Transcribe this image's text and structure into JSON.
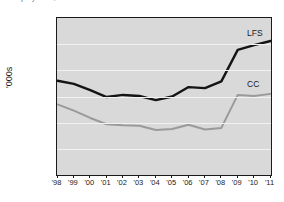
{
  "caption": {
    "clipped_text": "employment, 1998-2011"
  },
  "chart_data": {
    "type": "line",
    "title": "",
    "subtitle": "",
    "xlabel": "",
    "ylabel": "'000s",
    "x": [
      "'98",
      "'99",
      "'00",
      "'01",
      "'02",
      "'03",
      "'04",
      "'05",
      "'06",
      "'07",
      "'08",
      "'09",
      "'10",
      "'11"
    ],
    "ylim": [
      0,
      3000
    ],
    "yticks": [
      0,
      500,
      1000,
      1500,
      2000,
      2500,
      3000
    ],
    "ytick_labels": [
      "0",
      "500",
      "1000",
      "1500",
      "2000",
      "2500",
      "3000"
    ],
    "grid": true,
    "legend_position": "inline-annotation",
    "series": [
      {
        "name": "LFS",
        "color": "#141414",
        "values": [
          1800,
          1740,
          1620,
          1490,
          1530,
          1510,
          1430,
          1500,
          1680,
          1660,
          1790,
          2390,
          2480,
          2560
        ]
      },
      {
        "name": "CC",
        "color": "#9a9a9a",
        "values": [
          1350,
          1230,
          1090,
          970,
          950,
          940,
          860,
          880,
          960,
          870,
          900,
          1530,
          1510,
          1550
        ]
      }
    ],
    "annotations": [
      {
        "text": "LFS",
        "series": "LFS",
        "x": "'10"
      },
      {
        "text": "CC",
        "series": "CC",
        "x": "'10"
      }
    ]
  },
  "colors": {
    "plot_background": "#d9d9d9",
    "gridline": "#f2f2f2",
    "axis": "#1a1a1a",
    "page_background": "#ffffff"
  }
}
